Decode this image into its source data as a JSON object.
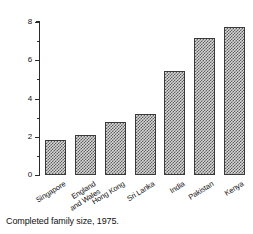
{
  "chart_data": {
    "type": "bar",
    "title": "",
    "caption": "Completed family size, 1975.",
    "xlabel": "",
    "ylabel": "No in completed family",
    "ylim": [
      0,
      8
    ],
    "grid": false,
    "legend": null,
    "y_ticks": [
      {
        "value": 0,
        "label": "0"
      },
      {
        "value": 1,
        "label": ""
      },
      {
        "value": 2,
        "label": "2"
      },
      {
        "value": 3,
        "label": ""
      },
      {
        "value": 4,
        "label": "4"
      },
      {
        "value": 5,
        "label": ""
      },
      {
        "value": 6,
        "label": "6"
      },
      {
        "value": 7,
        "label": ""
      },
      {
        "value": 8,
        "label": "8"
      }
    ],
    "categories": [
      "Singapore",
      "England\nand Wales",
      "Hong Kong",
      "Sri Lanka",
      "India",
      "Pakistan",
      "Kenya"
    ],
    "values": [
      1.85,
      2.08,
      2.75,
      3.2,
      5.45,
      7.15,
      7.75
    ],
    "bar_style": {
      "fill": "#d8d8d8",
      "hatch": "cross-hatch",
      "hatch_color": "#5c5c5c",
      "edge_color": "#3a3a3a"
    }
  },
  "axis": {
    "color": "#2a2a2a"
  }
}
